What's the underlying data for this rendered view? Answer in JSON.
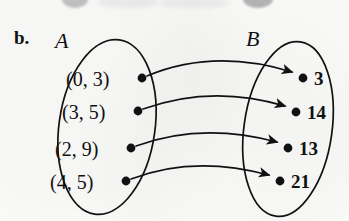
{
  "figure": {
    "part_label": "b.",
    "background_color": "#fbfbfa",
    "ink_color": "#111111"
  },
  "sets": {
    "domain": {
      "name": "A",
      "label_x": 55,
      "label_y": 30,
      "ellipse": {
        "cx": 107,
        "cy": 127,
        "rx": 48,
        "ry": 88,
        "rotate": 8
      },
      "elements": [
        {
          "text": "(0, 3)",
          "dot_x": 142,
          "dot_y": 78,
          "text_x": 66,
          "text_y": 69
        },
        {
          "text": "(3, 5)",
          "dot_x": 138,
          "dot_y": 111,
          "text_x": 62,
          "text_y": 102
        },
        {
          "text": "(2, 9)",
          "dot_x": 131,
          "dot_y": 148,
          "text_x": 55,
          "text_y": 139
        },
        {
          "text": "(4, 5)",
          "dot_x": 126,
          "dot_y": 181,
          "text_x": 50,
          "text_y": 172
        }
      ]
    },
    "codomain": {
      "name": "B",
      "label_x": 246,
      "label_y": 28,
      "ellipse": {
        "cx": 288,
        "cy": 129,
        "rx": 44,
        "ry": 88,
        "rotate": 8
      },
      "elements": [
        {
          "text": "3",
          "dot_x": 303,
          "dot_y": 78,
          "text_x": 314,
          "text_y": 69
        },
        {
          "text": "14",
          "dot_x": 296,
          "dot_y": 112,
          "text_x": 307,
          "text_y": 103
        },
        {
          "text": "13",
          "dot_x": 288,
          "dot_y": 148,
          "text_x": 299,
          "text_y": 139
        },
        {
          "text": "21",
          "dot_x": 280,
          "dot_y": 181,
          "text_x": 291,
          "text_y": 172
        }
      ]
    }
  },
  "mapping": [
    {
      "from": "(0, 3)",
      "to": "3",
      "path": "M 147,76 C 190,58 240,56 292,72"
    },
    {
      "from": "(3, 5)",
      "to": "14",
      "path": "M 143,109 C 190,92 238,92 285,106"
    },
    {
      "from": "(2, 9)",
      "to": "13",
      "path": "M 136,146 C 185,128 232,130 277,142"
    },
    {
      "from": "(4, 5)",
      "to": "21",
      "path": "M 131,179 C 180,160 228,164 269,175"
    }
  ],
  "chart_data": {
    "type": "diagram",
    "title": "b.",
    "categories": [
      "(0, 3)",
      "(3, 5)",
      "(2, 9)",
      "(4, 5)"
    ],
    "values": [
      "3",
      "14",
      "13",
      "21"
    ],
    "pairs": [
      [
        "(0, 3)",
        "3"
      ],
      [
        "(3, 5)",
        "14"
      ],
      [
        "(2, 9)",
        "13"
      ],
      [
        "(4, 5)",
        "21"
      ]
    ],
    "xlabel": "A",
    "ylabel": "B"
  }
}
